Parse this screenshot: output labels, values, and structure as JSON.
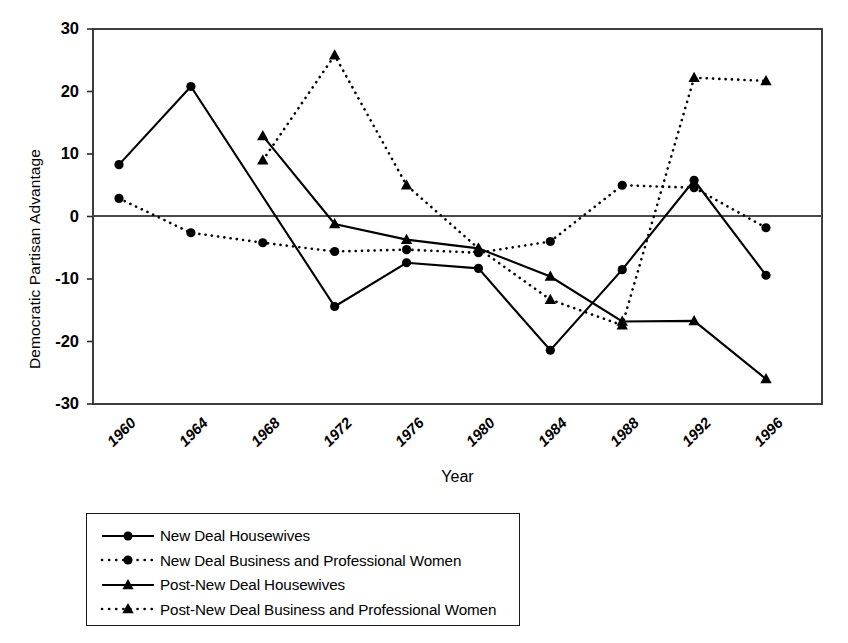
{
  "chart_data": {
    "type": "line",
    "title": "",
    "xlabel": "Year",
    "ylabel": "Democratic Partisan Advantage",
    "x": [
      1960,
      1964,
      1968,
      1972,
      1976,
      1980,
      1984,
      1988,
      1992,
      1996
    ],
    "categories": [
      "1960",
      "1964",
      "1968",
      "1972",
      "1976",
      "1980",
      "1984",
      "1988",
      "1992",
      "1996"
    ],
    "xlim": [
      1958,
      1998
    ],
    "ylim": [
      -30,
      30
    ],
    "yticks": [
      "30",
      "20",
      "10",
      "0",
      "-10",
      "-20",
      "-30"
    ],
    "ytick_values": [
      30,
      20,
      10,
      0,
      -10,
      -20,
      -30
    ],
    "grid": false,
    "zero_line": true,
    "legend_position": "below-left",
    "series": [
      {
        "name": "New Deal Housewives",
        "marker": "circle",
        "linestyle": "solid",
        "color": "#000000",
        "x": [
          1960,
          1964,
          1972,
          1976,
          1980,
          1984,
          1988,
          1992,
          1996
        ],
        "values": [
          8.3,
          20.8,
          -14.4,
          -7.4,
          -8.3,
          -21.4,
          -8.5,
          5.8,
          -9.4
        ]
      },
      {
        "name": "New Deal Business and Professional Women",
        "marker": "circle",
        "linestyle": "dotted",
        "color": "#000000",
        "x": [
          1960,
          1964,
          1968,
          1972,
          1976,
          1980,
          1984,
          1988,
          1992,
          1996
        ],
        "values": [
          2.9,
          -2.6,
          -4.2,
          -5.6,
          -5.3,
          -5.8,
          -4.0,
          5.0,
          4.6,
          -1.8
        ]
      },
      {
        "name": "Post-New Deal Housewives",
        "marker": "triangle",
        "linestyle": "solid",
        "color": "#000000",
        "x": [
          1968,
          1972,
          1976,
          1980,
          1984,
          1988,
          1992,
          1996
        ],
        "values": [
          12.9,
          -1.2,
          -3.7,
          -5.1,
          -9.6,
          -16.8,
          -16.7,
          -26.0
        ]
      },
      {
        "name": "Post-New Deal Business and Professional Women",
        "marker": "triangle",
        "linestyle": "dotted",
        "color": "#000000",
        "x": [
          1968,
          1972,
          1976,
          1980,
          1984,
          1988,
          1992,
          1996
        ],
        "values": [
          9.0,
          25.8,
          5.0,
          -5.1,
          -13.3,
          -17.4,
          22.2,
          21.7
        ]
      }
    ]
  },
  "axis": {
    "ylabel": "Democratic Partisan Advantage",
    "xlabel": "Year",
    "yticks": [
      "30",
      "20",
      "10",
      "0",
      "-10",
      "-20",
      "-30"
    ],
    "xticks": [
      "1960",
      "1964",
      "1968",
      "1972",
      "1976",
      "1980",
      "1984",
      "1988",
      "1992",
      "1996"
    ]
  },
  "legend": {
    "items": [
      {
        "label": "New Deal Housewives",
        "marker": "circle",
        "linestyle": "solid"
      },
      {
        "label": "New Deal Business and Professional Women",
        "marker": "circle",
        "linestyle": "dotted"
      },
      {
        "label": "Post-New Deal Housewives",
        "marker": "triangle",
        "linestyle": "solid"
      },
      {
        "label": "Post-New Deal Business and Professional Women",
        "marker": "triangle",
        "linestyle": "dotted"
      }
    ]
  },
  "style": {
    "ink": "#000000",
    "frame": "#2b2b2b",
    "background": "#ffffff"
  }
}
